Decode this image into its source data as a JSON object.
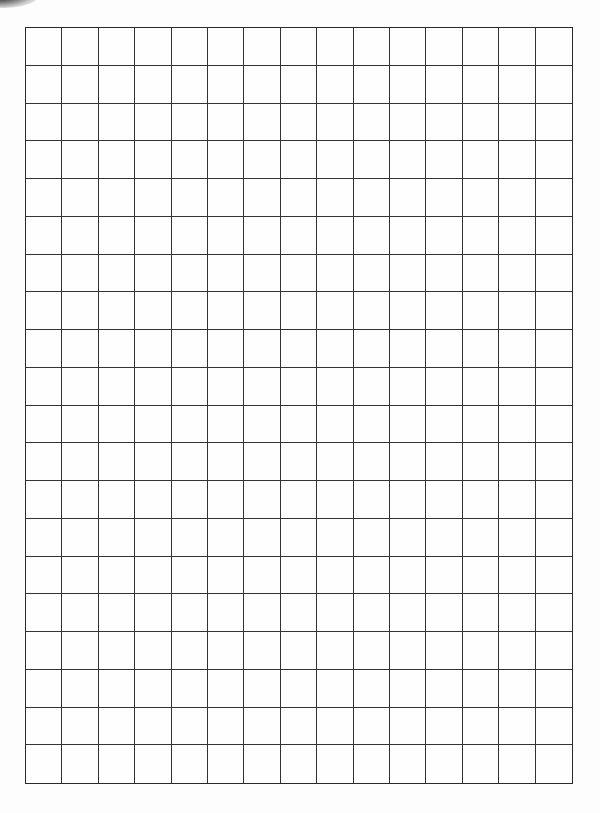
{
  "sheet": {
    "type": "graph-paper",
    "columns": 15,
    "rows": 20,
    "line_color": "#333333",
    "background_color": "#fdfdfd"
  }
}
